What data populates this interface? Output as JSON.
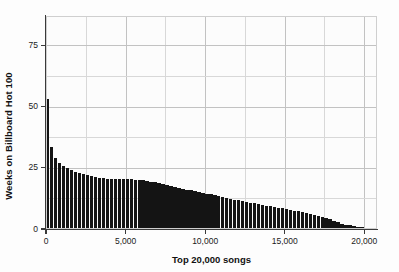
{
  "chart_data": {
    "type": "bar",
    "title": "",
    "subtitle": "",
    "xlabel": "Top 20,000 songs",
    "ylabel": "Weeks on Billboard Hot 100",
    "xlim": [
      0,
      20800
    ],
    "ylim": [
      0,
      87
    ],
    "grid": true,
    "legend": null,
    "xticks": [
      0,
      5000,
      10000,
      15000,
      20000
    ],
    "xticklabels": [
      "0",
      "5,000",
      "10,000",
      "15,000",
      "20,000"
    ],
    "yticks": [
      0,
      25,
      50,
      75
    ],
    "yticklabels": [
      "0",
      "25",
      "50",
      "75"
    ],
    "x_minor_gridlines": [
      2500,
      7500,
      12500,
      17500
    ],
    "y_minor_gridlines": [
      12.5,
      37.5,
      62.5
    ],
    "bar_color": "#141414",
    "n_bars": 80,
    "bin_width": 250,
    "x": [
      125,
      375,
      625,
      875,
      1125,
      1375,
      1625,
      1875,
      2125,
      2375,
      2625,
      2875,
      3125,
      3375,
      3625,
      3875,
      4125,
      4375,
      4625,
      4875,
      5125,
      5375,
      5625,
      5875,
      6125,
      6375,
      6625,
      6875,
      7125,
      7375,
      7625,
      7875,
      8125,
      8375,
      8625,
      8875,
      9125,
      9375,
      9625,
      9875,
      10125,
      10375,
      10625,
      10875,
      11125,
      11375,
      11625,
      11875,
      12125,
      12375,
      12625,
      12875,
      13125,
      13375,
      13625,
      13875,
      14125,
      14375,
      14625,
      14875,
      15125,
      15375,
      15625,
      15875,
      16125,
      16375,
      16625,
      16875,
      17125,
      17375,
      17625,
      17875,
      18125,
      18375,
      18625,
      18875,
      19125,
      19375,
      19625,
      19875
    ],
    "values": [
      53.0,
      33.5,
      29.0,
      27.0,
      25.8,
      24.8,
      24.0,
      23.4,
      22.9,
      22.4,
      22.0,
      21.6,
      21.3,
      21.0,
      20.8,
      20.6,
      20.5,
      20.4,
      20.4,
      20.3,
      20.3,
      20.3,
      20.2,
      20.1,
      19.9,
      19.6,
      19.3,
      19.0,
      18.6,
      18.2,
      17.8,
      17.4,
      17.0,
      16.7,
      16.4,
      16.1,
      15.8,
      15.5,
      15.2,
      14.9,
      14.5,
      14.1,
      13.7,
      13.3,
      12.9,
      12.6,
      12.3,
      12.0,
      11.7,
      11.4,
      11.1,
      10.8,
      10.5,
      10.2,
      9.9,
      9.6,
      9.3,
      9.0,
      8.7,
      8.4,
      8.1,
      7.8,
      7.5,
      7.2,
      6.9,
      6.5,
      6.1,
      5.7,
      5.3,
      4.9,
      4.4,
      3.9,
      3.3,
      2.7,
      2.2,
      1.8,
      1.5,
      1.2,
      1.0,
      0.9
    ]
  },
  "axes": {
    "y_title": "Weeks on Billboard Hot 100",
    "x_title": "Top 20,000 songs"
  }
}
